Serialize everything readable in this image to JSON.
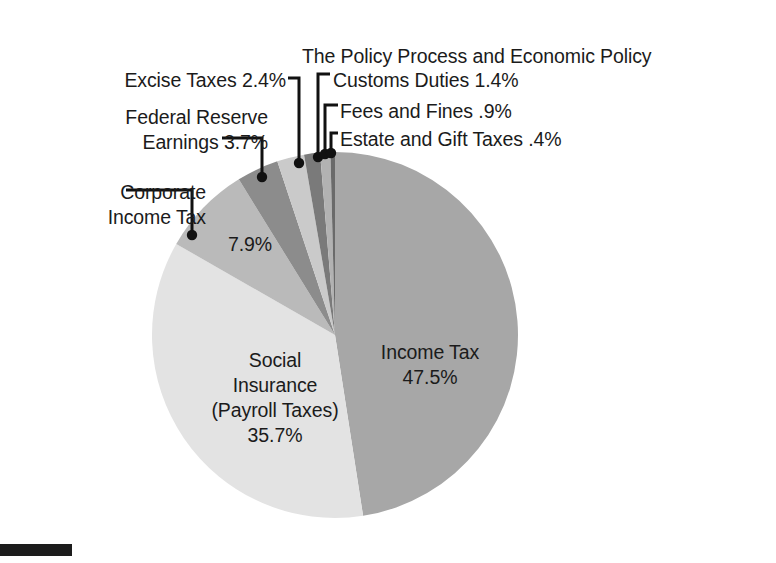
{
  "title": "The Policy Process and Economic Policy",
  "footer_rule": "",
  "chart_data": {
    "type": "pie",
    "title": "The Policy Process and Economic Policy",
    "xlabel": "",
    "ylabel": "",
    "legend_position": "callout-labels",
    "grid": false,
    "start_angle_deg": 0,
    "direction": "clockwise",
    "unit": "percent",
    "categories": [
      "Income Tax",
      "Social Insurance (Payroll Taxes)",
      "Corporate Income Tax",
      "Federal Reserve Earnings",
      "Excise Taxes",
      "Customs Duties",
      "Fees and Fines",
      "Estate and Gift Taxes"
    ],
    "values": [
      47.5,
      35.7,
      7.9,
      3.7,
      2.4,
      1.4,
      0.9,
      0.4
    ],
    "value_labels": [
      "47.5%",
      "35.7%",
      "7.9%",
      "3.7%",
      "2.4%",
      "1.4%",
      ".9%",
      ".4%"
    ],
    "colors": [
      "#a7a7a7",
      "#e3e3e3",
      "#bababa",
      "#8c8c8c",
      "#cacaca",
      "#7a7a7a",
      "#b2b2b2",
      "#6a6a6a"
    ],
    "slices": [
      {
        "name": "Income Tax",
        "value": 47.5,
        "label": "Income Tax",
        "pct_text": "47.5%",
        "color": "#a7a7a7",
        "label_placement": "inside"
      },
      {
        "name": "Social Insurance (Payroll Taxes)",
        "value": 35.7,
        "label": "Social Insurance (Payroll Taxes)",
        "pct_text": "35.7%",
        "color": "#e3e3e3",
        "label_placement": "inside"
      },
      {
        "name": "Corporate Income Tax",
        "value": 7.9,
        "label": "Corporate Income Tax",
        "pct_text": "7.9%",
        "color": "#bababa",
        "label_placement": "callout-left"
      },
      {
        "name": "Federal Reserve Earnings",
        "value": 3.7,
        "label": "Federal Reserve Earnings",
        "pct_text": "3.7%",
        "color": "#8c8c8c",
        "label_placement": "callout-left"
      },
      {
        "name": "Excise Taxes",
        "value": 2.4,
        "label": "Excise Taxes",
        "pct_text": "2.4%",
        "color": "#cacaca",
        "label_placement": "callout-left"
      },
      {
        "name": "Customs Duties",
        "value": 1.4,
        "label": "Customs Duties",
        "pct_text": "1.4%",
        "color": "#7a7a7a",
        "label_placement": "callout-right"
      },
      {
        "name": "Fees and Fines",
        "value": 0.9,
        "label": "Fees and Fines",
        "pct_text": ".9%",
        "color": "#b2b2b2",
        "label_placement": "callout-right"
      },
      {
        "name": "Estate and Gift Taxes",
        "value": 0.4,
        "label": "Estate and Gift Taxes",
        "pct_text": ".4%",
        "color": "#6a6a6a",
        "label_placement": "callout-right"
      }
    ]
  },
  "labels": {
    "income_tax_name": "Income Tax",
    "income_tax_pct": "47.5%",
    "social_line1": "Social",
    "social_line2": "Insurance",
    "social_line3": "(Payroll Taxes)",
    "social_pct": "35.7%",
    "corporate_line1": "Corporate",
    "corporate_line2": "Income Tax",
    "corporate_pct": "7.9%",
    "federal_line1": "Federal Reserve",
    "federal_line2": "Earnings 3.7%",
    "excise": "Excise Taxes 2.4%",
    "customs": "Customs Duties 1.4%",
    "fees": "Fees and Fines .9%",
    "estate": "Estate and Gift Taxes .4%"
  },
  "style": {
    "background": "#ffffff",
    "text_color": "#1b1b1b",
    "leader_color": "#111111",
    "footer_bar_color": "#1c1c1c"
  }
}
